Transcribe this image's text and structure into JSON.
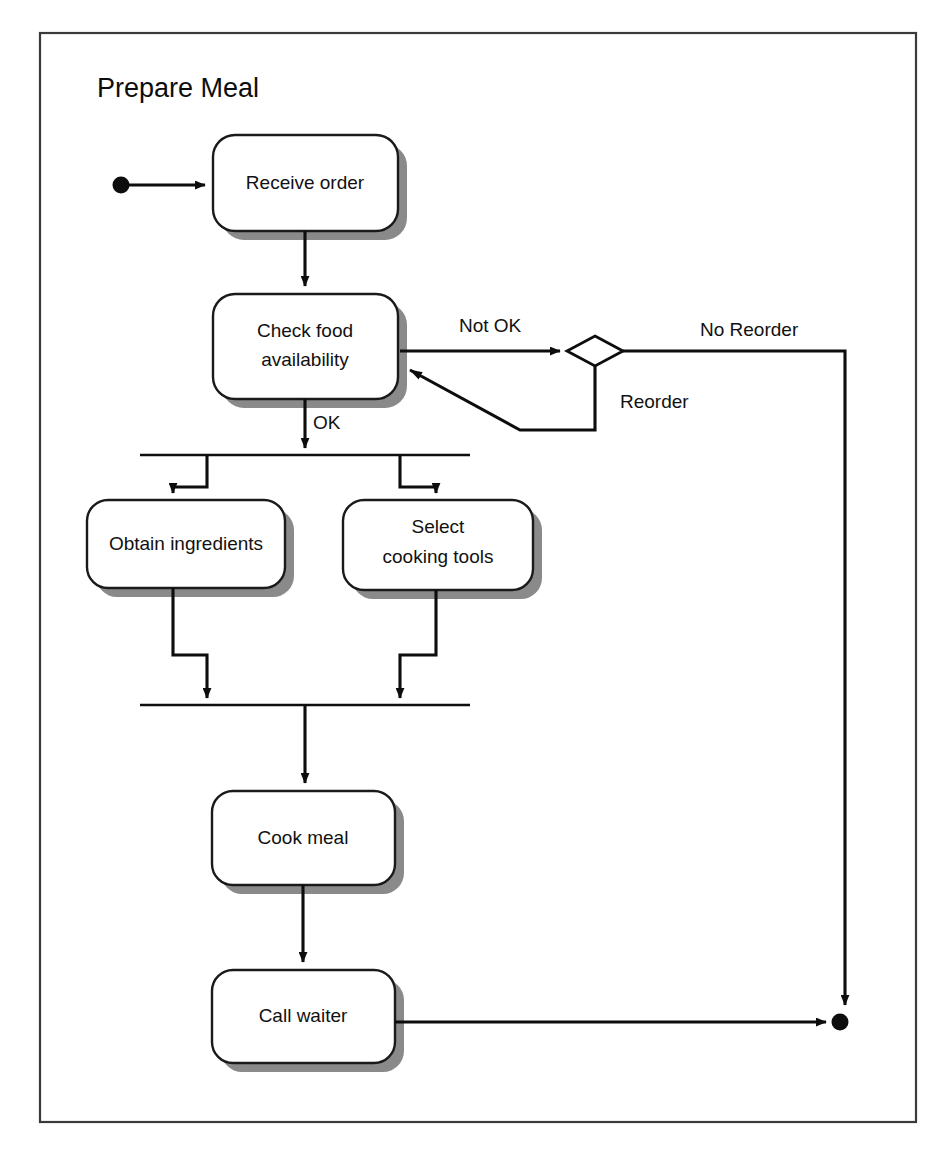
{
  "diagram": {
    "kind": "uml-activity-diagram",
    "title": "Prepare Meal",
    "colors": {
      "frame_border": "#3a3a3a",
      "line": "#0d0d0d",
      "box_fill": "#ffffff",
      "box_border": "#1a1a1a",
      "shadow": "#8a8a8a",
      "text": "#111111",
      "background": "#ffffff"
    },
    "frame": {
      "x": 40,
      "y": 33,
      "width": 876,
      "height": 1089
    },
    "nodes": {
      "start": {
        "label": "",
        "type": "initial-node",
        "cx": 121,
        "cy": 185,
        "r": 8
      },
      "end": {
        "label": "",
        "type": "final-node",
        "cx": 840,
        "cy": 1022,
        "r": 8
      },
      "decision": {
        "label": "",
        "type": "decision",
        "cx": 595,
        "cy": 351,
        "rx": 28,
        "ry": 15
      }
    },
    "activities": [
      {
        "id": "receive-order",
        "label": "Receive order",
        "lines": [
          "Receive order"
        ],
        "x": 213,
        "y": 135,
        "width": 185,
        "height": 96
      },
      {
        "id": "check-food-availability",
        "label": "Check food availability",
        "lines": [
          "Check food",
          "availability"
        ],
        "x": 213,
        "y": 294,
        "width": 185,
        "height": 105
      },
      {
        "id": "obtain-ingredients",
        "label": "Obtain ingredients",
        "lines": [
          "Obtain ingredients"
        ],
        "x": 87,
        "y": 500,
        "width": 198,
        "height": 88
      },
      {
        "id": "select-cooking-tools",
        "label": "Select cooking tools",
        "lines": [
          "Select",
          "cooking tools"
        ],
        "x": 343,
        "y": 500,
        "width": 190,
        "height": 90
      },
      {
        "id": "cook-meal",
        "label": "Cook meal",
        "lines": [
          "Cook meal"
        ],
        "x": 212,
        "y": 791,
        "width": 183,
        "height": 94
      },
      {
        "id": "call-waiter",
        "label": "Call waiter",
        "lines": [
          "Call waiter"
        ],
        "x": 212,
        "y": 970,
        "width": 183,
        "height": 93
      }
    ],
    "bars": [
      {
        "id": "fork-bar",
        "type": "fork",
        "x1": 140,
        "y1": 455,
        "x2": 470,
        "y2": 455
      },
      {
        "id": "join-bar",
        "type": "join",
        "x1": 140,
        "y1": 705,
        "x2": 470,
        "y2": 705
      }
    ],
    "guards": [
      {
        "id": "guard-not-ok",
        "text": "Not OK",
        "x": 459,
        "y": 328
      },
      {
        "id": "guard-no-reorder",
        "text": "No Reorder",
        "x": 700,
        "y": 332
      },
      {
        "id": "guard-reorder",
        "text": "Reorder",
        "x": 620,
        "y": 404
      },
      {
        "id": "guard-ok",
        "text": "OK",
        "x": 313,
        "y": 425
      }
    ],
    "transitions": [
      {
        "id": "start-to-receive-order",
        "from": "start",
        "to": "receive-order",
        "guard": ""
      },
      {
        "id": "receive-order-to-check",
        "from": "receive-order",
        "to": "check-food-availability",
        "guard": ""
      },
      {
        "id": "check-to-decision",
        "from": "check-food-availability",
        "to": "decision",
        "guard": "Not OK"
      },
      {
        "id": "decision-to-end",
        "from": "decision",
        "to": "end",
        "guard": "No Reorder"
      },
      {
        "id": "decision-to-check",
        "from": "decision",
        "to": "check-food-availability",
        "guard": "Reorder"
      },
      {
        "id": "check-to-fork",
        "from": "check-food-availability",
        "to": "fork-bar",
        "guard": "OK"
      },
      {
        "id": "fork-to-obtain",
        "from": "fork-bar",
        "to": "obtain-ingredients",
        "guard": ""
      },
      {
        "id": "fork-to-select",
        "from": "fork-bar",
        "to": "select-cooking-tools",
        "guard": ""
      },
      {
        "id": "obtain-to-join",
        "from": "obtain-ingredients",
        "to": "join-bar",
        "guard": ""
      },
      {
        "id": "select-to-join",
        "from": "select-cooking-tools",
        "to": "join-bar",
        "guard": ""
      },
      {
        "id": "join-to-cook",
        "from": "join-bar",
        "to": "cook-meal",
        "guard": ""
      },
      {
        "id": "cook-to-call-waiter",
        "from": "cook-meal",
        "to": "call-waiter",
        "guard": ""
      },
      {
        "id": "call-waiter-to-end",
        "from": "call-waiter",
        "to": "end",
        "guard": ""
      }
    ]
  }
}
